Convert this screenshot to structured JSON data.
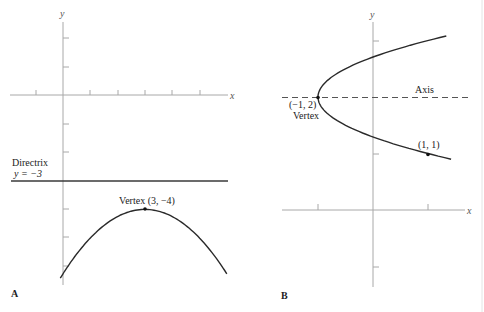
{
  "figure": {
    "panels": [
      {
        "id": "A",
        "label": "A",
        "x_axis_label": "x",
        "y_axis_label": "y",
        "directrix": {
          "title": "Directrix",
          "equation": "y = −3"
        },
        "vertex_label": "Vertex (3, −4)",
        "equation": "y = -(1/4)(x - 3)^2 - 4",
        "vertex": [
          3,
          -4
        ],
        "directrix_y": -3
      },
      {
        "id": "B",
        "label": "B",
        "x_axis_label": "x",
        "y_axis_label": "y",
        "axis_label": "Axis",
        "vertex_coords_label": "(−1, 2)",
        "vertex_word": "Vertex",
        "point_label": "(1, 1)",
        "equation": "x = 2(y - 2)^2 - 1",
        "vertex": [
          -1,
          2
        ],
        "point": [
          1,
          1
        ]
      }
    ]
  }
}
